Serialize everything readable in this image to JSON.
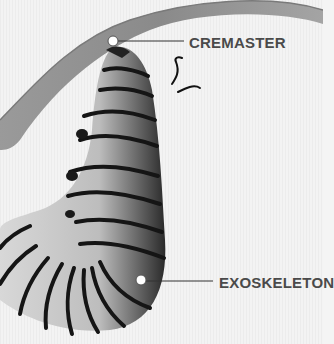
{
  "diagram": {
    "labels": [
      {
        "id": "cremaster",
        "text": "CREMASTER"
      },
      {
        "id": "exoskeleton",
        "text": "EXOSKELETON"
      }
    ],
    "colors": {
      "background": "#f4f4f4",
      "leaf": "#8a8a8a",
      "label_text": "#4a4a4a",
      "leader_line": "#333333",
      "marker_fill": "#ffffff"
    }
  }
}
